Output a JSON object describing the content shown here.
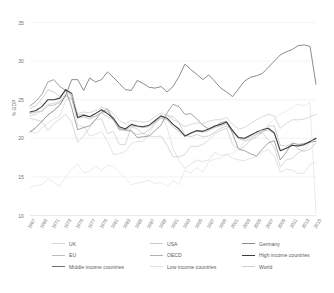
{
  "chart_data": {
    "type": "line",
    "title": "",
    "xlabel": "",
    "ylabel": "% GDP",
    "ylim": [
      10,
      35
    ],
    "yticks": [
      35,
      30,
      25,
      20,
      15,
      10
    ],
    "grid": true,
    "legend_position": "bottom",
    "x": [
      1967,
      1968,
      1969,
      1970,
      1971,
      1972,
      1973,
      1974,
      1975,
      1976,
      1977,
      1978,
      1979,
      1980,
      1981,
      1982,
      1983,
      1984,
      1985,
      1986,
      1987,
      1988,
      1989,
      1990,
      1991,
      1992,
      1993,
      1994,
      1995,
      1996,
      1997,
      1998,
      1999,
      2000,
      2001,
      2002,
      2003,
      2004,
      2005,
      2006,
      2007,
      2008,
      2009,
      2010,
      2011,
      2012,
      2013,
      2014,
      2015
    ],
    "xtick_labels": [
      "1967",
      "1969",
      "1971",
      "1973",
      "1975",
      "1977",
      "1979",
      "1981",
      "1983",
      "1985",
      "1987",
      "1989",
      "1991",
      "1993",
      "1995",
      "1997",
      "1999",
      "2001",
      "2003",
      "2005",
      "2007",
      "2009",
      "2011",
      "2013",
      "2015"
    ],
    "series": [
      {
        "name": "UK",
        "color": "#d8d8d8",
        "width": 0.7,
        "values": [
          21.0,
          20.6,
          21.3,
          22.0,
          22.5,
          22.9,
          24.9,
          25.4,
          21.7,
          21.5,
          20.3,
          20.5,
          20.9,
          19.6,
          17.9,
          18.0,
          18.3,
          19.3,
          19.6,
          19.6,
          20.6,
          22.1,
          23.1,
          21.4,
          18.7,
          17.1,
          16.1,
          16.7,
          17.2,
          17.0,
          17.2,
          18.2,
          17.8,
          17.9,
          17.4,
          17.2,
          17.1,
          17.4,
          17.6,
          18.2,
          18.6,
          17.7,
          15.6,
          16.0,
          15.9,
          15.4,
          15.5,
          16.6,
          16.9
        ]
      },
      {
        "name": "USA",
        "color": "#c8c8c8",
        "width": 0.7,
        "values": [
          22.6,
          22.4,
          22.2,
          21.0,
          21.9,
          22.5,
          23.1,
          22.1,
          19.5,
          20.3,
          21.4,
          22.5,
          22.5,
          20.6,
          20.9,
          19.2,
          19.2,
          21.5,
          21.2,
          20.6,
          20.3,
          20.2,
          20.3,
          19.1,
          17.6,
          17.6,
          17.9,
          19.0,
          18.9,
          19.2,
          19.8,
          20.6,
          21.0,
          21.3,
          19.2,
          18.6,
          18.9,
          19.8,
          20.5,
          20.7,
          19.8,
          18.8,
          16.3,
          17.2,
          17.4,
          18.1,
          18.5,
          19.5,
          20.0
        ]
      },
      {
        "name": "Germany",
        "color": "#8a8a8a",
        "width": 0.8,
        "values": [
          24.2,
          24.8,
          25.7,
          27.3,
          27.6,
          26.7,
          26.2,
          24.0,
          21.1,
          21.4,
          21.6,
          22.4,
          23.4,
          23.8,
          22.4,
          21.1,
          21.1,
          21.0,
          20.1,
          20.2,
          20.3,
          21.0,
          21.7,
          23.3,
          24.4,
          24.1,
          23.1,
          23.2,
          22.5,
          21.7,
          21.2,
          21.5,
          22.0,
          22.2,
          20.6,
          18.6,
          18.4,
          18.0,
          17.7,
          18.6,
          19.4,
          19.7,
          17.2,
          18.2,
          19.4,
          19.2,
          19.3,
          19.5,
          19.6
        ]
      },
      {
        "name": "EU",
        "color": "#bdbdbd",
        "width": 0.7,
        "values": [
          23.9,
          24.2,
          25.1,
          26.3,
          26.0,
          25.4,
          26.3,
          25.4,
          23.0,
          23.1,
          22.8,
          22.8,
          23.3,
          23.5,
          22.3,
          21.3,
          21.0,
          20.9,
          20.5,
          20.6,
          21.1,
          21.9,
          22.7,
          23.0,
          22.8,
          22.1,
          20.4,
          20.2,
          20.5,
          20.2,
          20.3,
          20.8,
          21.3,
          21.6,
          21.0,
          20.0,
          19.7,
          19.8,
          20.2,
          20.8,
          21.6,
          21.6,
          19.1,
          19.0,
          19.3,
          18.6,
          18.3,
          18.6,
          19.4
        ]
      },
      {
        "name": "OECD",
        "color": "#b0b0b0",
        "width": 0.7,
        "values": [
          23.2,
          23.4,
          23.5,
          24.2,
          24.3,
          24.6,
          25.5,
          25.1,
          22.6,
          22.8,
          22.5,
          22.9,
          23.3,
          22.8,
          22.4,
          21.3,
          21.0,
          21.6,
          21.5,
          21.4,
          21.5,
          22.1,
          22.6,
          22.4,
          21.5,
          20.9,
          20.2,
          20.6,
          20.9,
          20.8,
          21.0,
          21.4,
          21.6,
          21.9,
          20.8,
          20.0,
          19.9,
          20.2,
          20.6,
          20.9,
          21.1,
          20.6,
          18.4,
          18.7,
          19.1,
          19.0,
          19.1,
          19.5,
          19.9
        ]
      },
      {
        "name": "High income countries",
        "color": "#3c3c3c",
        "width": 1.1,
        "values": [
          23.4,
          23.6,
          24.1,
          25.0,
          25.0,
          25.2,
          26.3,
          25.8,
          22.7,
          23.0,
          22.8,
          23.2,
          23.7,
          23.2,
          22.6,
          21.5,
          21.2,
          21.8,
          21.6,
          21.5,
          21.7,
          22.3,
          22.9,
          22.6,
          21.8,
          21.2,
          20.3,
          20.7,
          21.0,
          20.9,
          21.2,
          21.6,
          21.8,
          22.1,
          21.0,
          20.1,
          20.0,
          20.4,
          20.8,
          21.1,
          21.3,
          20.7,
          18.4,
          18.7,
          19.1,
          19.0,
          19.2,
          19.6,
          20.0
        ]
      },
      {
        "name": "Middle income countries",
        "color": "#6f6f6f",
        "width": 0.8,
        "values": [
          20.8,
          21.4,
          22.2,
          23.0,
          23.6,
          24.3,
          25.6,
          27.6,
          27.6,
          26.2,
          27.8,
          27.3,
          27.6,
          28.6,
          27.9,
          27.1,
          26.3,
          26.2,
          27.5,
          27.1,
          26.6,
          26.5,
          26.7,
          26.0,
          26.7,
          28.0,
          29.6,
          28.9,
          28.3,
          27.6,
          28.2,
          27.4,
          26.5,
          26.0,
          25.4,
          26.4,
          27.4,
          27.9,
          28.1,
          28.4,
          29.2,
          30.0,
          30.8,
          31.2,
          31.5,
          32.0,
          32.1,
          31.9,
          27.0
        ]
      },
      {
        "name": "Low income countries",
        "color": "#e2e2e2",
        "width": 0.7,
        "values": [
          13.6,
          13.9,
          14.0,
          14.8,
          14.3,
          13.8,
          15.0,
          16.0,
          16.7,
          15.5,
          15.7,
          16.4,
          15.8,
          16.5,
          16.4,
          15.6,
          14.8,
          14.0,
          14.2,
          14.3,
          14.6,
          14.1,
          14.3,
          13.8,
          14.5,
          14.0,
          15.9,
          15.5,
          16.2,
          15.6,
          17.0,
          17.3,
          17.4,
          17.9,
          18.0,
          18.7,
          19.6,
          20.1,
          20.6,
          21.2,
          21.8,
          22.5,
          23.1,
          23.5,
          24.0,
          24.4,
          24.2,
          24.6,
          10.3
        ]
      },
      {
        "name": "World",
        "color": "#cfcfcf",
        "width": 0.8,
        "values": [
          22.9,
          23.1,
          23.6,
          24.4,
          24.5,
          24.8,
          25.8,
          25.7,
          23.2,
          23.4,
          23.3,
          23.6,
          24.0,
          23.8,
          23.2,
          22.3,
          21.9,
          22.3,
          22.2,
          22.1,
          22.2,
          22.8,
          23.3,
          23.0,
          22.4,
          22.0,
          21.5,
          21.8,
          22.0,
          21.9,
          22.2,
          22.4,
          22.4,
          22.7,
          21.8,
          21.2,
          21.4,
          21.9,
          22.4,
          22.8,
          23.1,
          22.9,
          21.3,
          21.9,
          22.4,
          22.4,
          22.5,
          22.8,
          23.1
        ]
      }
    ]
  },
  "legend": {
    "rows": [
      [
        {
          "label": "UK",
          "color": "#d8d8d8",
          "width": 0.9
        },
        {
          "label": "USA",
          "color": "#c8c8c8",
          "width": 0.9
        },
        {
          "label": "Germany",
          "color": "#8a8a8a",
          "width": 1.0
        }
      ],
      [
        {
          "label": "EU",
          "color": "#bdbdbd",
          "width": 0.9
        },
        {
          "label": "OECD",
          "color": "#b0b0b0",
          "width": 0.9
        },
        {
          "label": "High income countries",
          "color": "#3c3c3c",
          "width": 1.6
        }
      ],
      [
        {
          "label": "Middle income countries",
          "color": "#6f6f6f",
          "width": 1.0
        },
        {
          "label": "Low income countries",
          "color": "#e2e2e2",
          "width": 0.9
        },
        {
          "label": "World",
          "color": "#cfcfcf",
          "width": 1.0
        }
      ]
    ]
  }
}
